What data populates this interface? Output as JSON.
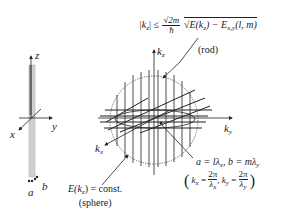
{
  "diagram": {
    "left_panel": {
      "axes": {
        "z": "z",
        "y": "y",
        "x": "x"
      },
      "rod_cross_section_labels": {
        "a": "a",
        "b": "b"
      }
    },
    "right_panel": {
      "axes": {
        "kz": "k",
        "kz_sub": "z",
        "ky": "k",
        "ky_sub": "y",
        "kx": "k",
        "kx_sub": "x"
      },
      "rod_equation": {
        "lhs": "|k",
        "lhs_sub": "z",
        "lhs_close": "| ≤",
        "frac_num": "√2m",
        "frac_den": "ħ",
        "sqrt_body": "E(k",
        "sqrt_body_sub": "z",
        "sqrt_body_rest": ") − E",
        "sqrt_body_sub2": "x,y",
        "sqrt_body_end": "(l, m)"
      },
      "rod_label": "(rod)",
      "sphere_label_line1": "E(k",
      "sphere_label_sub": "z",
      "sphere_label_rest": ") = const.",
      "sphere_label_line2": "(sphere)",
      "lattice_relation": "a = lλ",
      "lattice_relation_sub1": "x",
      "lattice_relation_mid": ", b = mλ",
      "lattice_relation_sub2": "y",
      "wavevector_def": {
        "kx": "k",
        "kx_sub": "x",
        "eq1": " = ",
        "num1": "2π",
        "den1": "λ",
        "den1_sub": "x",
        "sep": ", ",
        "ky": "k",
        "ky_sub": "y",
        "eq2": " = ",
        "num2": "2π",
        "den2": "λ",
        "den2_sub": "y"
      }
    }
  }
}
